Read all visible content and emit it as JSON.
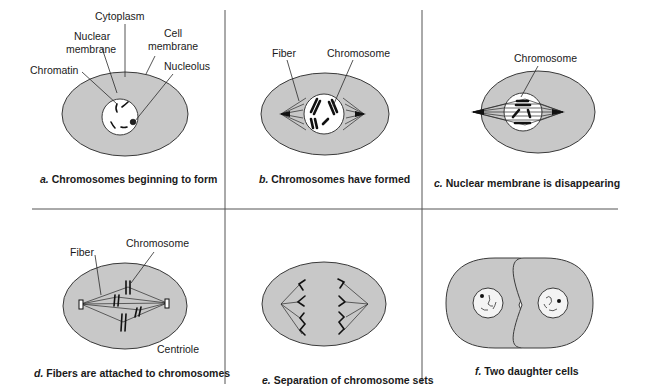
{
  "figure": {
    "panels": [
      {
        "id": "a",
        "letter": "a.",
        "caption": "Chromosomes beginning to form",
        "labels": {
          "cytoplasm": "Cytoplasm",
          "nuclear_membrane_1": "Nuclear",
          "nuclear_membrane_2": "membrane",
          "cell_membrane_1": "Cell",
          "cell_membrane_2": "membrane",
          "chromatin": "Chromatin",
          "nucleolus": "Nucleolus"
        }
      },
      {
        "id": "b",
        "letter": "b.",
        "caption": "Chromosomes have formed",
        "labels": {
          "fiber": "Fiber",
          "chromosome": "Chromosome"
        }
      },
      {
        "id": "c",
        "letter": "c.",
        "caption": "Nuclear membrane is disappearing",
        "labels": {
          "chromosome": "Chromosome"
        }
      },
      {
        "id": "d",
        "letter": "d.",
        "caption": "Fibers are attached to chromosomes",
        "labels": {
          "fiber": "Fiber",
          "chromosome": "Chromosome",
          "centriole": "Centriole"
        }
      },
      {
        "id": "e",
        "letter": "e.",
        "caption": "Separation of chromosome sets",
        "labels": {}
      },
      {
        "id": "f",
        "letter": "f.",
        "caption": "Two daughter cells",
        "labels": {}
      }
    ],
    "colors": {
      "cytoplasm_fill": "#c8c8c8",
      "nucleus_fill": "#ffffff",
      "outline": "#3a3a3a",
      "divider": "#555555"
    }
  }
}
